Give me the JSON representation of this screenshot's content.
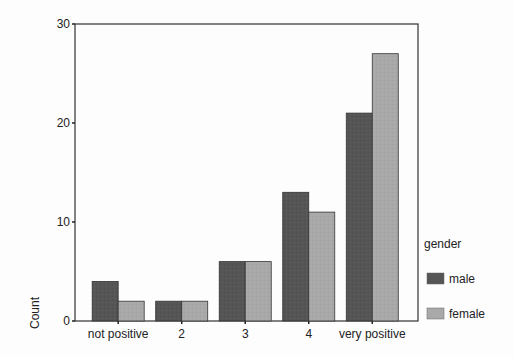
{
  "chart_data": {
    "type": "bar",
    "title": "",
    "xlabel": "",
    "ylabel": "Count",
    "ylim": [
      0,
      30
    ],
    "yticks": [
      0,
      10,
      20,
      30
    ],
    "grid": false,
    "legend_position": "right",
    "legend_title": "gender",
    "categories": [
      "not positive",
      "2",
      "3",
      "4",
      "very positive"
    ],
    "series": [
      {
        "name": "male",
        "color": "#555555",
        "values": [
          4,
          2,
          6,
          13,
          21
        ]
      },
      {
        "name": "female",
        "color": "#a9a9a9",
        "values": [
          2,
          2,
          6,
          11,
          27
        ]
      }
    ]
  }
}
